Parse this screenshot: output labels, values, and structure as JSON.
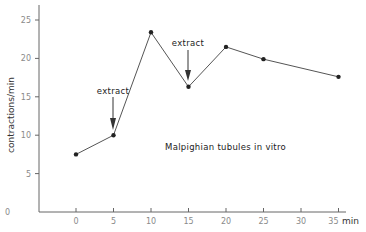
{
  "chart_data": {
    "type": "line",
    "title": "",
    "xlabel": "min",
    "ylabel": "contractions/min",
    "x": [
      0,
      5,
      10,
      15,
      20,
      25,
      35
    ],
    "series": [
      {
        "name": "Malpighian tubules in vitro",
        "values": [
          7.5,
          10,
          23.4,
          16.3,
          21.5,
          19.9,
          17.6
        ]
      }
    ],
    "x_ticks": [
      0,
      5,
      10,
      15,
      20,
      25,
      30,
      35
    ],
    "y_ticks": [
      0,
      5,
      10,
      15,
      20,
      25
    ],
    "xlim": [
      -5,
      35
    ],
    "ylim": [
      0,
      27
    ],
    "grid": false,
    "legend": "none",
    "annotations": [
      {
        "text": "extract",
        "x": 5,
        "y": 10,
        "type": "arrow-down"
      },
      {
        "text": "extract",
        "x": 15,
        "y": 16.3,
        "type": "arrow-down"
      },
      {
        "text": "Malpighian tubules  in vitro",
        "x": 20,
        "y": 9,
        "type": "label"
      }
    ]
  },
  "labels": {
    "ylabel": "contractions/min",
    "xunit": "min",
    "extract1": "extract",
    "extract2": "extract",
    "caption": "Malpighian tubules  in vitro"
  },
  "colors": {
    "line": "#555555",
    "marker": "#222222",
    "axis": "#666666",
    "tick_text": "#8a8a8a"
  }
}
